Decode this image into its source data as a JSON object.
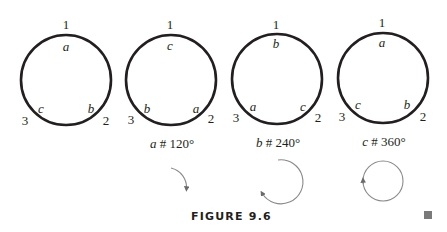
{
  "figure": {
    "title": "FIGURE 9.6",
    "panels": [
      {
        "vertices": {
          "top": "1",
          "bottom_left": "3",
          "bottom_right": "2"
        },
        "inner_labels": {
          "top": "a",
          "bottom_left": "c",
          "bottom_right": "b"
        },
        "caption": null,
        "rotation_arrow": null
      },
      {
        "vertices": {
          "top": "1",
          "bottom_left": "3",
          "bottom_right": "2"
        },
        "inner_labels": {
          "top": "c",
          "bottom_left": "b",
          "bottom_right": "a"
        },
        "caption": {
          "var": "a",
          "rest": " # 120°"
        },
        "rotation_arrow": "120°"
      },
      {
        "vertices": {
          "top": "1",
          "bottom_left": "3",
          "bottom_right": "2"
        },
        "inner_labels": {
          "top": "b",
          "bottom_left": "a",
          "bottom_right": "c"
        },
        "caption": {
          "var": "b",
          "rest": " # 240°"
        },
        "rotation_arrow": "240°"
      },
      {
        "vertices": {
          "top": "1",
          "bottom_left": "3",
          "bottom_right": "2"
        },
        "inner_labels": {
          "top": "a",
          "bottom_left": "c",
          "bottom_right": "b"
        },
        "caption": {
          "var": "c",
          "rest": " # 360°"
        },
        "rotation_arrow": "360°"
      }
    ],
    "colors": {
      "ink": "#231f20",
      "arrow": "#8a8a8a",
      "endmark": "#7a7a7a"
    }
  }
}
